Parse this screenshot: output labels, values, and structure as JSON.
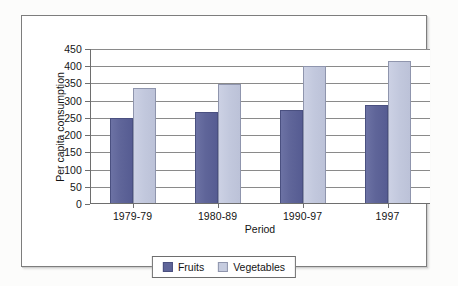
{
  "chart_data": {
    "type": "bar",
    "title": "",
    "xlabel": "Period",
    "ylabel": "Per capita consumption",
    "categories": [
      "1979-79",
      "1980-89",
      "1990-97",
      "1997"
    ],
    "series": [
      {
        "name": "Fruits",
        "color": "#5f6599",
        "values": [
          250,
          266,
          272,
          288
        ]
      },
      {
        "name": "Vegetables",
        "color": "#c6ccdf",
        "values": [
          337,
          349,
          400,
          415
        ]
      }
    ],
    "ylim": [
      0,
      450
    ],
    "ytick_step": 50,
    "yticks": [
      "450",
      "400",
      "350",
      "300",
      "250",
      "200",
      "150",
      "100",
      "50",
      "0"
    ],
    "grid": true,
    "legend_position": "bottom"
  },
  "legend": {
    "items": [
      {
        "label": "Fruits"
      },
      {
        "label": "Vegetables"
      }
    ]
  }
}
